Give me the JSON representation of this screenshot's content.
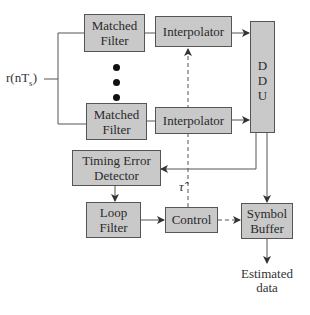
{
  "diagram": {
    "input_label": "r(nT",
    "input_subscript": "s",
    "input_close": ")",
    "blocks": {
      "matched_filter_1": {
        "line1": "Matched",
        "line2": "Filter"
      },
      "matched_filter_2": {
        "line1": "Matched",
        "line2": "Filter"
      },
      "interpolator_1": "Interpolator",
      "interpolator_2": "Interpolator",
      "ddu": [
        "D",
        "D",
        "U"
      ],
      "timing_error_detector": {
        "line1": "Timing Error",
        "line2": "Detector"
      },
      "loop_filter": {
        "line1": "Loop",
        "line2": "Filter"
      },
      "control": "Control",
      "symbol_buffer": {
        "line1": "Symbol",
        "line2": "Buffer"
      }
    },
    "tau_hat_label": "τ̂",
    "output_label": {
      "line1": "Estimated",
      "line2": "data"
    },
    "colors": {
      "box_fill": "#c9c9c9",
      "box_border": "#555555",
      "line": "#444444"
    }
  }
}
